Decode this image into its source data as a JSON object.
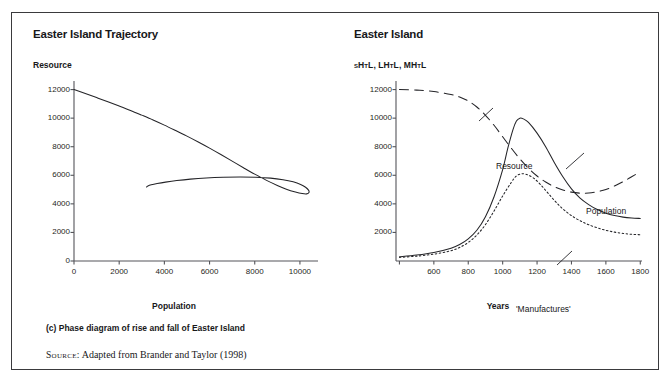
{
  "figure": {
    "source_key": "Source:",
    "source_text": " Adapted from Brander and Taylor (1998)",
    "caption_c": "(c) Phase diagram of rise and fall of Easter Island",
    "caption_d": "(d) Time profile for Easter Island"
  },
  "panel_left": {
    "title": "Easter Island Trajectory",
    "ylabel": "Resource",
    "xlabel": "Population"
  },
  "panel_right": {
    "title": "Easter Island",
    "ylabel": "sHtL, LHtL, MHtL",
    "xlabel": "Years"
  },
  "chart_data": [
    {
      "id": "phase-diagram",
      "type": "line",
      "title": "Easter Island Trajectory",
      "subtitle": "(c) Phase diagram of rise and fall of Easter Island",
      "xlabel": "Population",
      "ylabel": "Resource",
      "xlim": [
        0,
        10800
      ],
      "ylim": [
        0,
        12600
      ],
      "xticks": [
        0,
        2000,
        4000,
        6000,
        8000,
        10000
      ],
      "yticks": [
        0,
        2000,
        4000,
        6000,
        8000,
        10000,
        12000
      ],
      "grid": false,
      "legend": "none",
      "series": [
        {
          "name": "Trajectory",
          "style": "solid",
          "annotation": "Counter-clockwise spiral: resource declines as population grows, overshoots, then collapses back",
          "points": [
            [
              0,
              12000
            ],
            [
              500,
              11720
            ],
            [
              1000,
              11440
            ],
            [
              1500,
              11150
            ],
            [
              2000,
              10850
            ],
            [
              2500,
              10540
            ],
            [
              3000,
              10210
            ],
            [
              3500,
              9870
            ],
            [
              4000,
              9510
            ],
            [
              4500,
              9130
            ],
            [
              5000,
              8740
            ],
            [
              5500,
              8330
            ],
            [
              6000,
              7900
            ],
            [
              6500,
              7450
            ],
            [
              7000,
              6990
            ],
            [
              7500,
              6530
            ],
            [
              8000,
              6080
            ],
            [
              8500,
              5660
            ],
            [
              9000,
              5290
            ],
            [
              9400,
              5030
            ],
            [
              9800,
              4830
            ],
            [
              10100,
              4720
            ],
            [
              10300,
              4700
            ],
            [
              10400,
              4790
            ],
            [
              10380,
              4960
            ],
            [
              10250,
              5160
            ],
            [
              10030,
              5360
            ],
            [
              9700,
              5540
            ],
            [
              9250,
              5690
            ],
            [
              8700,
              5800
            ],
            [
              8050,
              5860
            ],
            [
              7350,
              5880
            ],
            [
              6600,
              5860
            ],
            [
              5850,
              5810
            ],
            [
              5150,
              5730
            ],
            [
              4550,
              5630
            ],
            [
              4050,
              5520
            ],
            [
              3680,
              5420
            ],
            [
              3420,
              5330
            ],
            [
              3270,
              5250
            ],
            [
              3210,
              5180
            ]
          ]
        }
      ]
    },
    {
      "id": "time-profile",
      "type": "line",
      "title": "Easter Island",
      "subtitle": "(d) Time profile for Easter Island",
      "xlabel": "Years",
      "ylabel": "sHtL, LHtL, MHtL",
      "xlim": [
        380,
        1810
      ],
      "ylim": [
        0,
        12600
      ],
      "xticks": [
        400,
        600,
        800,
        1000,
        1200,
        1400,
        1600,
        1800
      ],
      "xticklabels": [
        "",
        "600",
        "800",
        "1000",
        "1200",
        "1400",
        "1600",
        "1800"
      ],
      "yticks": [
        2000,
        4000,
        6000,
        8000,
        10000,
        12000
      ],
      "grid": false,
      "legend": "inline-annotations",
      "series": [
        {
          "name": "Resource",
          "style": "long-dashed",
          "label_text": "Resource",
          "points": [
            [
              400,
              12000
            ],
            [
              500,
              11960
            ],
            [
              600,
              11860
            ],
            [
              700,
              11660
            ],
            [
              750,
              11480
            ],
            [
              800,
              11200
            ],
            [
              850,
              10780
            ],
            [
              900,
              10200
            ],
            [
              950,
              9500
            ],
            [
              1000,
              8700
            ],
            [
              1050,
              7900
            ],
            [
              1100,
              7150
            ],
            [
              1150,
              6500
            ],
            [
              1200,
              5950
            ],
            [
              1250,
              5530
            ],
            [
              1300,
              5200
            ],
            [
              1350,
              4970
            ],
            [
              1400,
              4820
            ],
            [
              1450,
              4750
            ],
            [
              1500,
              4760
            ],
            [
              1550,
              4850
            ],
            [
              1600,
              5000
            ],
            [
              1650,
              5250
            ],
            [
              1700,
              5550
            ],
            [
              1750,
              5900
            ],
            [
              1800,
              6250
            ]
          ]
        },
        {
          "name": "Population",
          "style": "solid",
          "label_text": "Population",
          "points": [
            [
              400,
              300
            ],
            [
              500,
              420
            ],
            [
              600,
              600
            ],
            [
              700,
              900
            ],
            [
              750,
              1150
            ],
            [
              800,
              1550
            ],
            [
              850,
              2150
            ],
            [
              900,
              3100
            ],
            [
              950,
              4500
            ],
            [
              1000,
              6400
            ],
            [
              1030,
              7900
            ],
            [
              1060,
              9200
            ],
            [
              1080,
              9800
            ],
            [
              1100,
              10000
            ],
            [
              1120,
              9950
            ],
            [
              1150,
              9700
            ],
            [
              1200,
              8950
            ],
            [
              1250,
              8000
            ],
            [
              1300,
              6900
            ],
            [
              1350,
              5900
            ],
            [
              1400,
              5050
            ],
            [
              1450,
              4400
            ],
            [
              1500,
              3950
            ],
            [
              1550,
              3600
            ],
            [
              1600,
              3350
            ],
            [
              1650,
              3180
            ],
            [
              1700,
              3070
            ],
            [
              1750,
              3010
            ],
            [
              1800,
              2980
            ]
          ]
        },
        {
          "name": "'Manufactures'",
          "style": "dotted",
          "label_text": "'Manufactures'",
          "points": [
            [
              400,
              250
            ],
            [
              500,
              340
            ],
            [
              600,
              480
            ],
            [
              700,
              720
            ],
            [
              750,
              950
            ],
            [
              800,
              1300
            ],
            [
              850,
              1820
            ],
            [
              900,
              2550
            ],
            [
              950,
              3500
            ],
            [
              1000,
              4550
            ],
            [
              1050,
              5500
            ],
            [
              1080,
              5950
            ],
            [
              1110,
              6100
            ],
            [
              1140,
              6050
            ],
            [
              1180,
              5800
            ],
            [
              1220,
              5350
            ],
            [
              1260,
              4800
            ],
            [
              1300,
              4250
            ],
            [
              1340,
              3750
            ],
            [
              1380,
              3350
            ],
            [
              1420,
              3020
            ],
            [
              1460,
              2760
            ],
            [
              1500,
              2540
            ],
            [
              1550,
              2320
            ],
            [
              1600,
              2150
            ],
            [
              1650,
              2020
            ],
            [
              1700,
              1930
            ],
            [
              1750,
              1870
            ],
            [
              1800,
              1840
            ]
          ]
        }
      ]
    }
  ]
}
